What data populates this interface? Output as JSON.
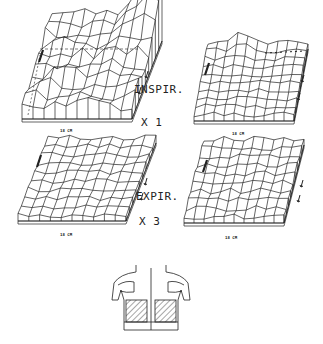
{
  "figure": {
    "labels": {
      "inspiration": "INSPIR.",
      "inspiration_scale": "X 1",
      "expiration": "EXPIR.",
      "expiration_scale": "X 3"
    },
    "axis_label": "18 CM",
    "plots": [
      {
        "id": "inspir-left",
        "phase": "INSPIR.",
        "scale": "X 1",
        "axis": "18 CM"
      },
      {
        "id": "inspir-right",
        "phase": "INSPIR.",
        "scale": "X 1",
        "axis": "18 CM"
      },
      {
        "id": "expir-left",
        "phase": "EXPIR.",
        "scale": "X 3",
        "axis": "18 CM"
      },
      {
        "id": "expir-right",
        "phase": "EXPIR.",
        "scale": "X 3",
        "axis": "18 CM"
      }
    ],
    "diagram": "torso-back-view-with-hatched-lung-regions",
    "colors": {
      "ink": "#222222",
      "background": "#ffffff"
    }
  }
}
